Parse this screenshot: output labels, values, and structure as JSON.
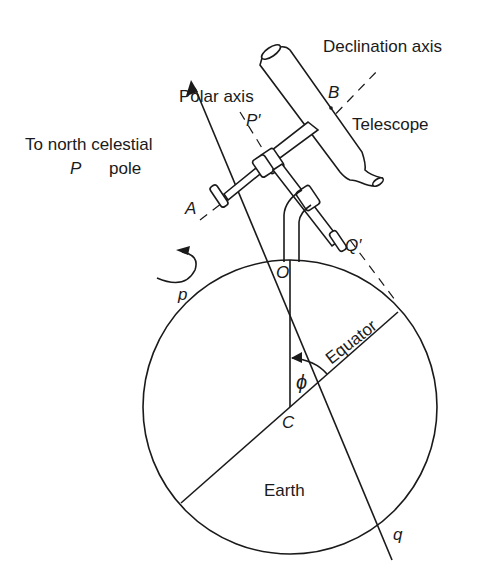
{
  "figure": {
    "labels": {
      "declination_axis": "Declination axis",
      "polar_axis": "Polar axis",
      "telescope": "Telescope",
      "to_north_celestial": "To north celestial",
      "pole": "pole",
      "point_P": "P",
      "point_P_prime": "P′",
      "point_A": "A",
      "point_B": "B",
      "point_Q_prime": "Q′",
      "point_O": "O",
      "point_p": "p",
      "point_C": "C",
      "point_q": "q",
      "angle_phi": "ϕ",
      "equator": "Equator",
      "earth": "Earth"
    },
    "colors": {
      "ink": "#1a1a1a",
      "background": "#ffffff"
    }
  }
}
